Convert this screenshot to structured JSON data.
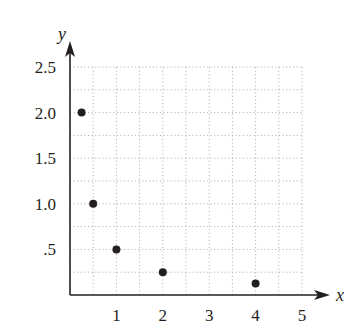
{
  "chart_data": {
    "type": "scatter",
    "title": "",
    "xlabel": "x",
    "ylabel": "y",
    "xlim": [
      0,
      5
    ],
    "ylim": [
      0,
      2.5
    ],
    "grid": true,
    "grid_style": "dotted",
    "x_minor_step": 0.5,
    "y_minor_step": 0.25,
    "x_ticks": [
      1,
      2,
      3,
      4,
      5
    ],
    "x_tick_labels": [
      "1",
      "2",
      "3",
      "4",
      "5"
    ],
    "y_ticks": [
      0.5,
      1.0,
      1.5,
      2.0,
      2.5
    ],
    "y_tick_labels": [
      ".5",
      "1.0",
      "1.5",
      "2.0",
      "2.5"
    ],
    "series": [
      {
        "name": "points",
        "x": [
          0.25,
          0.5,
          1,
          2,
          4
        ],
        "y": [
          2.0,
          1.0,
          0.5,
          0.25,
          0.125
        ]
      }
    ]
  },
  "colors": {
    "ink": "#231f20",
    "grid": "#b5b5b5"
  }
}
